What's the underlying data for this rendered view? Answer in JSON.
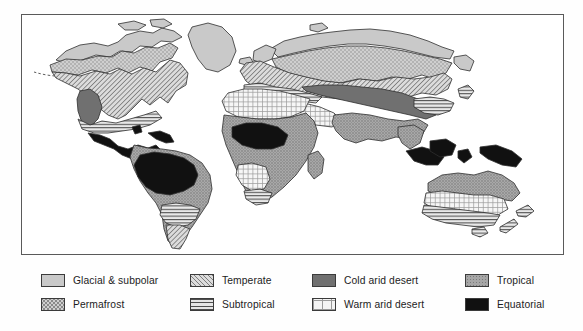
{
  "figure": {
    "kind": "world-climate-zone-map",
    "frame_border_color": "#5a5a5a",
    "background_color": "#ffffff"
  },
  "legend": {
    "columns": [
      {
        "items": [
          {
            "label": "Glacial & subpolar",
            "pattern": "solid-light-gray",
            "color": "#c9c9c9",
            "swatch_name": "swatch-glacial-subpolar"
          },
          {
            "label": "Permafrost",
            "pattern": "dotted-stipple",
            "color": "#cfcfcf",
            "swatch_name": "swatch-permafrost"
          }
        ]
      },
      {
        "items": [
          {
            "label": "Temperate",
            "pattern": "diagonal-hatch",
            "color": "#dcdcdc",
            "swatch_name": "swatch-temperate"
          },
          {
            "label": "Subtropical",
            "pattern": "horizontal-lines",
            "color": "#e6e6e6",
            "swatch_name": "swatch-subtropical"
          }
        ]
      },
      {
        "items": [
          {
            "label": "Cold arid desert",
            "pattern": "solid-dark-gray",
            "color": "#707070",
            "swatch_name": "swatch-cold-arid-desert"
          },
          {
            "label": "Warm arid desert",
            "pattern": "fine-grid",
            "color": "#f4f4f4",
            "swatch_name": "swatch-warm-arid-desert"
          }
        ]
      },
      {
        "items": [
          {
            "label": "Tropical",
            "pattern": "medium-gray-stipple",
            "color": "#a6a6a6",
            "swatch_name": "swatch-tropical"
          },
          {
            "label": "Equatorial",
            "pattern": "solid-black",
            "color": "#111111",
            "swatch_name": "swatch-equatorial"
          }
        ]
      }
    ]
  },
  "map_regions": [
    {
      "name": "greenland",
      "zone": "Glacial & subpolar"
    },
    {
      "name": "arctic-canada",
      "zone": "Glacial & subpolar"
    },
    {
      "name": "northern-siberia",
      "zone": "Glacial & subpolar"
    },
    {
      "name": "canada-permafrost-belt",
      "zone": "Permafrost"
    },
    {
      "name": "siberia-permafrost-belt",
      "zone": "Permafrost"
    },
    {
      "name": "north-america-temperate",
      "zone": "Temperate"
    },
    {
      "name": "europe-temperate",
      "zone": "Temperate"
    },
    {
      "name": "southern-south-america",
      "zone": "Temperate"
    },
    {
      "name": "southern-usa",
      "zone": "Subtropical"
    },
    {
      "name": "pampas",
      "zone": "Subtropical"
    },
    {
      "name": "mediterranean",
      "zone": "Subtropical"
    },
    {
      "name": "east-china",
      "zone": "Subtropical"
    },
    {
      "name": "southern-australia",
      "zone": "Subtropical"
    },
    {
      "name": "cape-south-africa",
      "zone": "Subtropical"
    },
    {
      "name": "great-basin-usa",
      "zone": "Cold arid desert"
    },
    {
      "name": "central-asia-gobi",
      "zone": "Cold arid desert"
    },
    {
      "name": "sahara",
      "zone": "Warm arid desert"
    },
    {
      "name": "arabia",
      "zone": "Warm arid desert"
    },
    {
      "name": "kalahari",
      "zone": "Warm arid desert"
    },
    {
      "name": "australia-interior",
      "zone": "Warm arid desert"
    },
    {
      "name": "south-america-tropical",
      "zone": "Tropical"
    },
    {
      "name": "sub-saharan-africa",
      "zone": "Tropical"
    },
    {
      "name": "india-southeast-asia",
      "zone": "Tropical"
    },
    {
      "name": "northern-australia",
      "zone": "Tropical"
    },
    {
      "name": "amazon-basin",
      "zone": "Equatorial"
    },
    {
      "name": "congo-basin",
      "zone": "Equatorial"
    },
    {
      "name": "central-america",
      "zone": "Equatorial"
    },
    {
      "name": "indonesia",
      "zone": "Equatorial"
    },
    {
      "name": "new-guinea",
      "zone": "Equatorial"
    }
  ]
}
